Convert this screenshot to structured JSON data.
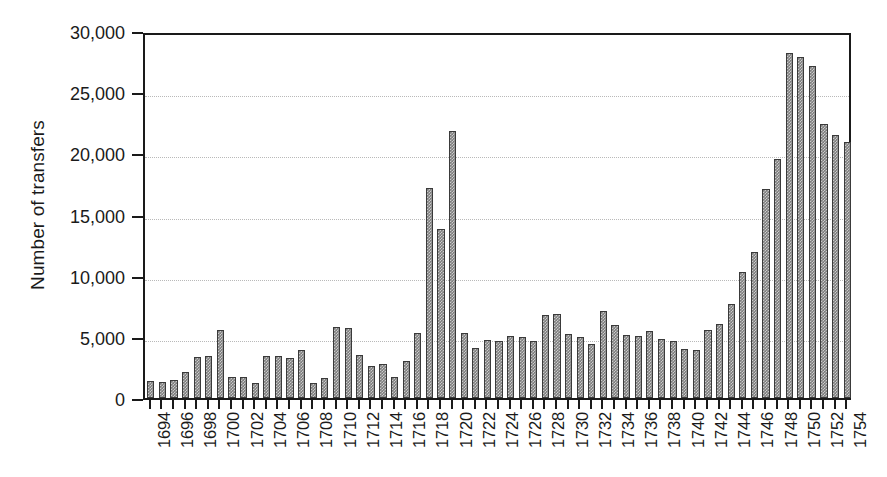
{
  "chart_data": {
    "type": "bar",
    "title": "",
    "xlabel": "",
    "ylabel": "Number of transfers",
    "ylim": [
      0,
      30000
    ],
    "xlim": [
      1694,
      1754
    ],
    "grid": true,
    "legend": false,
    "y_ticks": [
      0,
      5000,
      10000,
      15000,
      20000,
      25000,
      30000
    ],
    "y_tick_labels": [
      "0",
      "5,000",
      "10,000",
      "15,000",
      "20,000",
      "25,000",
      "30,000"
    ],
    "x_tick_labels": [
      "1694",
      "1696",
      "1698",
      "1700",
      "1702",
      "1704",
      "1706",
      "1708",
      "1710",
      "1712",
      "1714",
      "1716",
      "1718",
      "1720",
      "1722",
      "1724",
      "1726",
      "1728",
      "1730",
      "1732",
      "1734",
      "1736",
      "1738",
      "1740",
      "1742",
      "1744",
      "1746",
      "1748",
      "1750",
      "1752",
      "1754"
    ],
    "x_tick_step": 2,
    "categories": [
      1694,
      1695,
      1696,
      1697,
      1698,
      1699,
      1700,
      1701,
      1702,
      1703,
      1704,
      1705,
      1706,
      1707,
      1708,
      1709,
      1710,
      1711,
      1712,
      1713,
      1714,
      1715,
      1716,
      1717,
      1718,
      1719,
      1720,
      1721,
      1722,
      1723,
      1724,
      1725,
      1726,
      1727,
      1728,
      1729,
      1730,
      1731,
      1732,
      1733,
      1734,
      1735,
      1736,
      1737,
      1738,
      1739,
      1740,
      1741,
      1742,
      1743,
      1744,
      1745,
      1746,
      1747,
      1748,
      1749,
      1750,
      1751,
      1752,
      1753,
      1754
    ],
    "values": [
      1400,
      1350,
      1450,
      2150,
      3350,
      3450,
      5550,
      1750,
      1700,
      1200,
      3400,
      3400,
      3250,
      3950,
      1250,
      1600,
      5800,
      5750,
      3500,
      2600,
      2800,
      1700,
      3050,
      5300,
      17200,
      13800,
      21800,
      5300,
      4100,
      4750,
      4650,
      5100,
      5000,
      4650,
      6800,
      6850,
      5200,
      4950,
      4400,
      7150,
      6000,
      5150,
      5100,
      5500,
      4800,
      4700,
      4000,
      3950,
      5600,
      6050,
      7700,
      10300,
      11900,
      17100,
      19500,
      28200,
      27900,
      27100,
      22400,
      21500,
      20900
    ],
    "colors": {
      "bar_fill": "#7d7d7d",
      "bar_edge": "#3a3a3a",
      "axis": "#1a1a1a",
      "gridline": "#b9b9b9",
      "background": "#ffffff"
    }
  }
}
